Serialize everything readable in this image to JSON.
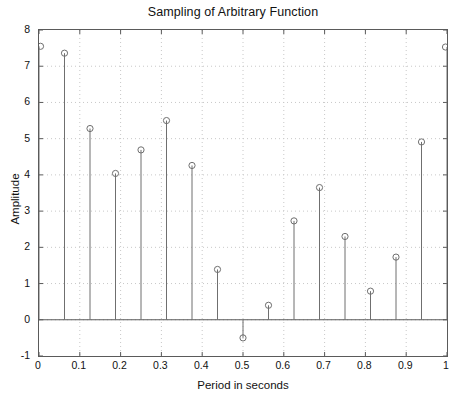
{
  "chart_data": {
    "type": "scatter",
    "plot_style": "stem",
    "title": "Sampling of Arbitrary Function",
    "xlabel": "Period in seconds",
    "ylabel": "Amplitude",
    "xlim": [
      0,
      1
    ],
    "ylim": [
      -1,
      8
    ],
    "grid": true,
    "grid_style": "dotted",
    "legend": null,
    "baseline": 0,
    "marker": "open-circle",
    "xticks": [
      "0",
      "0.1",
      "0.2",
      "0.3",
      "0.4",
      "0.5",
      "0.6",
      "0.7",
      "0.8",
      "0.9",
      "1"
    ],
    "xtick_values": [
      0,
      0.1,
      0.2,
      0.3,
      0.4,
      0.5,
      0.6,
      0.7,
      0.8,
      0.9,
      1
    ],
    "yticks": [
      "-1",
      "0",
      "1",
      "2",
      "3",
      "4",
      "5",
      "6",
      "7",
      "8"
    ],
    "ytick_values": [
      -1,
      0,
      1,
      2,
      3,
      4,
      5,
      6,
      7,
      8
    ],
    "x": [
      0,
      0.0625,
      0.125,
      0.1875,
      0.25,
      0.3125,
      0.375,
      0.4375,
      0.5,
      0.5625,
      0.625,
      0.6875,
      0.75,
      0.8125,
      0.875,
      0.9375,
      1
    ],
    "values": [
      7.55,
      7.36,
      5.28,
      4.04,
      4.69,
      5.5,
      4.26,
      1.39,
      -0.5,
      0.4,
      2.73,
      3.65,
      2.3,
      0.79,
      1.73,
      4.91,
      7.53
    ],
    "colors": {
      "axis": "#5a5a5a",
      "stem": "#6f6f6f",
      "marker": "#6f6f6f",
      "grid": "#c8c8c8",
      "background": "#ffffff",
      "text": "#111111"
    }
  }
}
